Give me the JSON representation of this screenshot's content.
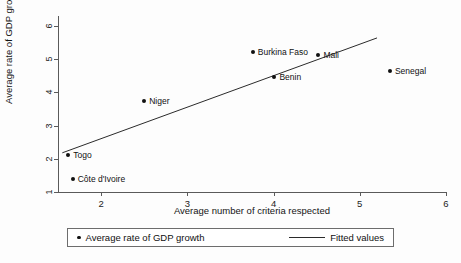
{
  "chart_data": {
    "type": "scatter",
    "title": "",
    "xlabel": "Average number of criteria respected",
    "ylabel": "Average rate of GDP growth",
    "xlim": [
      1.5,
      6.0
    ],
    "ylim": [
      1.0,
      6.3
    ],
    "xticks": [
      "2",
      "3",
      "4",
      "5",
      "6"
    ],
    "xtick_values": [
      2,
      3,
      4,
      5,
      6
    ],
    "yticks": [
      "1",
      "2",
      "3",
      "4",
      "5",
      "6"
    ],
    "ytick_values": [
      1,
      2,
      3,
      4,
      5,
      6
    ],
    "grid": false,
    "legend_position": "bottom",
    "points": [
      {
        "label": "Togo",
        "x": 1.62,
        "y": 2.1,
        "label_side": "right"
      },
      {
        "label": "Côte d'Ivoire",
        "x": 1.67,
        "y": 1.4,
        "label_side": "right"
      },
      {
        "label": "Niger",
        "x": 2.5,
        "y": 3.73,
        "label_side": "right"
      },
      {
        "label": "Burkina Faso",
        "x": 3.76,
        "y": 5.23,
        "label_side": "right"
      },
      {
        "label": "Benin",
        "x": 4.01,
        "y": 4.45,
        "label_side": "right"
      },
      {
        "label": "Mali",
        "x": 4.52,
        "y": 5.14,
        "label_side": "right"
      },
      {
        "label": "Senegal",
        "x": 5.35,
        "y": 4.64,
        "label_side": "right"
      }
    ],
    "fitted_line": {
      "name": "Fitted values",
      "x_start": 1.55,
      "y_start": 2.18,
      "x_end": 5.2,
      "y_end": 5.64
    },
    "legend": [
      {
        "marker": "dot",
        "label": "Average rate of GDP growth"
      },
      {
        "marker": "line",
        "label": "Fitted values"
      }
    ]
  },
  "colors": {
    "marker": "#111111",
    "line": "#2b2b2b",
    "axis": "#5a5a5a",
    "text": "#111111",
    "background": "#fdfdfd"
  }
}
